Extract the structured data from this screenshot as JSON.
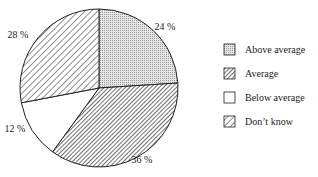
{
  "chart_data": {
    "type": "pie",
    "title": "",
    "slices": [
      {
        "name": "Above average",
        "value": 24,
        "label": "24%",
        "pattern": "dots"
      },
      {
        "name": "Average",
        "value": 36,
        "label": "36%",
        "pattern": "dense-hatch"
      },
      {
        "name": "Below average",
        "value": 12,
        "label": "12%",
        "pattern": "none"
      },
      {
        "name": "Don't know",
        "value": 28,
        "label": "28%",
        "pattern": "sparse-hatch"
      }
    ],
    "start": "12 o'clock",
    "direction": "clockwise",
    "legend_position": "right"
  }
}
